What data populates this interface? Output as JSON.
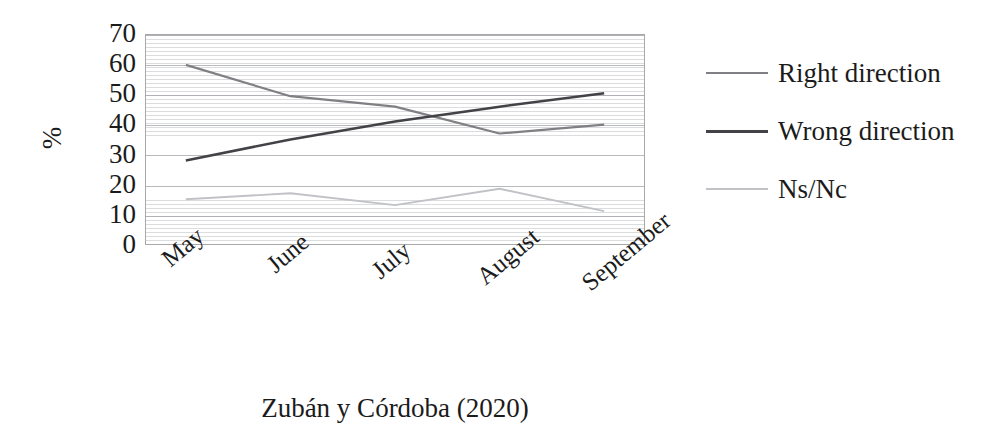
{
  "chart_data": {
    "type": "line",
    "title": "",
    "xlabel": "",
    "ylabel": "%",
    "categories": [
      "May",
      "June",
      "July",
      "August",
      "September"
    ],
    "ylim": [
      0,
      70
    ],
    "ytick_values": [
      70,
      60,
      50,
      40,
      30,
      20,
      10,
      0
    ],
    "grid": true,
    "legend_position": "right",
    "series": [
      {
        "name": "Right direction",
        "color": "#808084",
        "values": [
          60,
          49.5,
          46,
          37,
          40
        ]
      },
      {
        "name": "Wrong direction",
        "color": "#434347",
        "values": [
          28,
          35,
          41,
          46,
          50.5
        ]
      },
      {
        "name": "Ns/Nc",
        "color": "#c0c2c6",
        "values": [
          15,
          17,
          13,
          18.5,
          11
        ]
      }
    ],
    "source_caption": "Zubán y Córdoba (2020)"
  },
  "axis": {
    "y_label": "%",
    "y_ticks": [
      "70",
      "60",
      "50",
      "40",
      "30",
      "20",
      "10",
      "0"
    ],
    "x_ticks": [
      "May",
      "June",
      "July",
      "August",
      "September"
    ]
  },
  "legend": {
    "items": [
      {
        "label": "Right direction"
      },
      {
        "label": "Wrong direction"
      },
      {
        "label": "Ns/Nc"
      }
    ]
  },
  "caption": {
    "text": "Zubán y Córdoba (2020)"
  },
  "colors": {
    "right_direction": "#808084",
    "wrong_direction": "#434347",
    "ns_nc": "#c0c2c6",
    "plot_border": "#a8a8a8",
    "gridline": "#bec0c4",
    "text": "#1b1b1b"
  }
}
